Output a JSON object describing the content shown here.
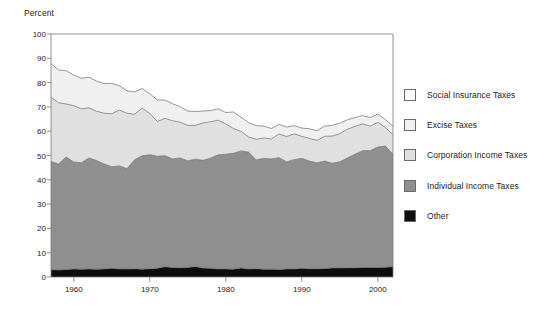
{
  "chart_data": {
    "type": "area",
    "stacked": true,
    "title": "",
    "subtitle": "",
    "xlabel": "",
    "ylabel": "Percent",
    "ylim": [
      0,
      100
    ],
    "xlim": [
      1957,
      2002
    ],
    "yticks": [
      0,
      10,
      20,
      30,
      40,
      50,
      60,
      70,
      80,
      90,
      100
    ],
    "ytick_labels": [
      "0",
      "10",
      "20",
      "30",
      "40",
      "50",
      "60",
      "70",
      "80",
      "90",
      "100"
    ],
    "xticks": [
      1960,
      1970,
      1980,
      1990,
      2000
    ],
    "xtick_labels": [
      "1960",
      "1970",
      "1980",
      "1990",
      "2000"
    ],
    "grid": false,
    "legend_position": "right",
    "stack_order_bottom_to_top": [
      "Other",
      "Individual Income Taxes",
      "Corporation Income Taxes",
      "Excise Taxes",
      "Social Insurance Taxes"
    ],
    "legend_order_top_to_bottom": [
      "Social Insurance Taxes",
      "Excise Taxes",
      "Corporation Income Taxes",
      "Individual Income Taxes",
      "Other"
    ],
    "x": [
      1957,
      1958,
      1959,
      1960,
      1961,
      1962,
      1963,
      1964,
      1965,
      1966,
      1967,
      1968,
      1969,
      1970,
      1971,
      1972,
      1973,
      1974,
      1975,
      1976,
      1977,
      1978,
      1979,
      1980,
      1981,
      1982,
      1983,
      1984,
      1985,
      1986,
      1987,
      1988,
      1989,
      1990,
      1991,
      1992,
      1993,
      1994,
      1995,
      1996,
      1997,
      1998,
      1999,
      2000,
      2001,
      2002
    ],
    "series": [
      {
        "name": "Other",
        "color": "#0d0d0d",
        "values": [
          3.0,
          2.9,
          3.1,
          3.3,
          3.2,
          3.3,
          3.2,
          3.3,
          3.6,
          3.3,
          3.3,
          3.4,
          3.2,
          3.4,
          3.6,
          4.2,
          3.9,
          3.8,
          3.9,
          4.3,
          3.7,
          3.6,
          3.3,
          3.3,
          3.2,
          3.7,
          3.3,
          3.4,
          3.2,
          3.2,
          3.1,
          3.3,
          3.3,
          3.6,
          3.4,
          3.4,
          3.5,
          3.7,
          3.7,
          3.8,
          3.8,
          3.9,
          3.9,
          3.9,
          4.0,
          4.2
        ]
      },
      {
        "name": "Individual Income Taxes",
        "color": "#8f8f8f",
        "values": [
          44.5,
          43.6,
          46.3,
          44.0,
          43.8,
          45.7,
          44.7,
          43.2,
          41.8,
          42.4,
          41.3,
          44.9,
          46.7,
          46.9,
          46.1,
          45.7,
          44.7,
          45.2,
          43.9,
          44.2,
          44.3,
          45.3,
          47.0,
          47.2,
          47.7,
          48.2,
          48.1,
          44.8,
          45.6,
          45.4,
          46.0,
          44.1,
          45.0,
          45.2,
          44.3,
          43.6,
          44.2,
          43.1,
          43.7,
          45.2,
          46.7,
          48.1,
          48.1,
          49.6,
          49.9,
          46.3
        ]
      },
      {
        "name": "Corporation Income Taxes",
        "color": "#e0e0e0",
        "values": [
          26.5,
          25.2,
          21.8,
          23.2,
          22.2,
          20.6,
          20.3,
          20.9,
          21.8,
          23.0,
          22.8,
          18.7,
          19.6,
          17.0,
          14.3,
          15.4,
          15.7,
          14.7,
          14.6,
          13.9,
          15.4,
          15.0,
          14.2,
          12.5,
          10.2,
          8.0,
          6.2,
          8.5,
          8.4,
          8.2,
          9.8,
          10.4,
          10.6,
          9.1,
          9.3,
          9.2,
          10.2,
          11.2,
          11.6,
          11.8,
          11.5,
          11.0,
          10.1,
          10.2,
          7.6,
          8.0
        ]
      },
      {
        "name": "Excise Taxes",
        "color": "#f0f0f0",
        "values": [
          13.8,
          13.5,
          13.7,
          12.6,
          12.6,
          12.6,
          12.4,
          12.2,
          12.5,
          10.0,
          9.2,
          9.2,
          8.1,
          8.1,
          8.9,
          7.5,
          7.0,
          6.4,
          5.9,
          5.7,
          4.9,
          4.6,
          4.7,
          4.7,
          6.8,
          5.9,
          5.9,
          5.6,
          4.9,
          4.3,
          3.9,
          3.9,
          3.4,
          3.4,
          4.0,
          4.0,
          4.2,
          4.4,
          4.3,
          3.9,
          3.6,
          3.4,
          3.5,
          3.4,
          3.3,
          3.6
        ]
      },
      {
        "name": "Social Insurance Taxes",
        "color": "#ffffff",
        "values": [
          12.2,
          14.8,
          15.1,
          16.9,
          18.2,
          17.8,
          19.4,
          20.4,
          20.3,
          21.3,
          23.4,
          23.8,
          22.4,
          24.6,
          27.1,
          27.2,
          28.7,
          29.9,
          31.7,
          31.9,
          31.7,
          31.5,
          30.8,
          32.3,
          32.1,
          34.2,
          36.5,
          37.7,
          37.9,
          38.9,
          37.2,
          38.3,
          37.7,
          38.7,
          39.0,
          39.8,
          37.9,
          37.6,
          36.7,
          35.3,
          34.4,
          33.6,
          34.4,
          32.9,
          35.2,
          37.9
        ]
      }
    ],
    "boundaries_note": "Cumulative top-of-band values; Social Insurance fills to 100."
  },
  "legend": {
    "items": [
      {
        "label": "Social Insurance Taxes",
        "color": "#ffffff"
      },
      {
        "label": "Excise Taxes",
        "color": "#f0f0f0"
      },
      {
        "label": "Corporation Income Taxes",
        "color": "#e0e0e0"
      },
      {
        "label": "Individual Income Taxes",
        "color": "#8f8f8f"
      },
      {
        "label": "Other",
        "color": "#0d0d0d"
      }
    ]
  },
  "axes": {
    "y_title": "Percent",
    "y_labels": [
      "100",
      "90",
      "80",
      "70",
      "60",
      "50",
      "40",
      "30",
      "20",
      "10",
      "0"
    ],
    "x_labels": [
      "1960",
      "1970",
      "1980",
      "1990",
      "2000"
    ]
  },
  "colors": {
    "axis": "#7a7a7a",
    "text": "#222222",
    "band_other": "#0d0d0d",
    "band_individual": "#8f8f8f",
    "band_corporation": "#e0e0e0",
    "band_excise": "#f0f0f0",
    "band_social": "#ffffff",
    "band_outline": "#6b6b6b"
  }
}
